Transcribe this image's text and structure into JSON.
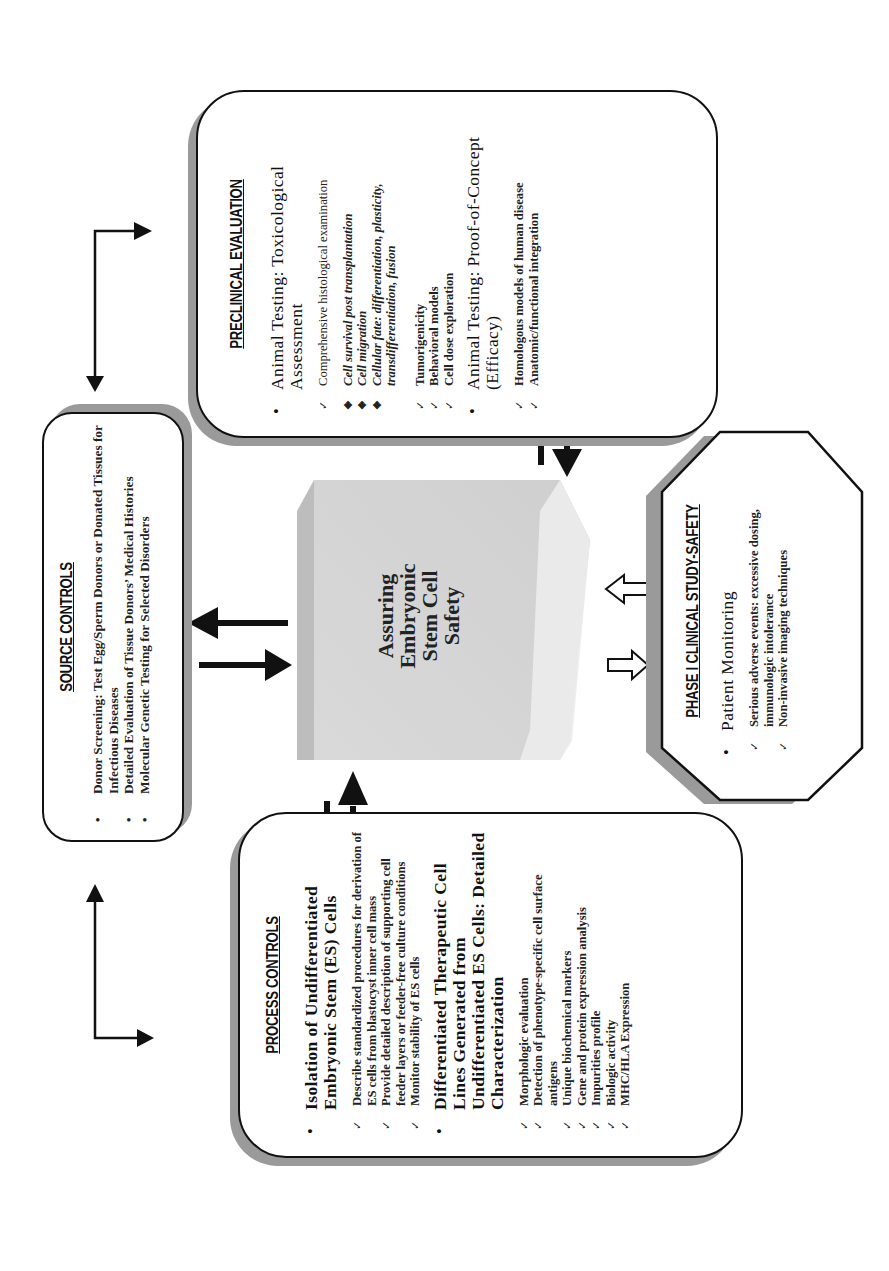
{
  "center": {
    "lines": [
      "Assuring",
      "Embryonic",
      "Stem Cell",
      "Safety"
    ]
  },
  "source_controls": {
    "title": "SOURCE CONTROLS",
    "items": [
      "Donor Screening: Test Egg/Sperm Donors or Donated Tissues for Infectious Diseases",
      "Detailed Evaluation of Tissue Donors’ Medical Histories",
      "Molecular Genetic Testing for Selected Disorders"
    ]
  },
  "preclinical_evaluation": {
    "title": "PRECLINICAL EVALUATION",
    "sections": [
      {
        "heading": "Animal Testing: Toxicological Assessment",
        "checks_a": [
          "Comprehensive histological examination"
        ],
        "sub_items": [
          "Cell survival post transplantation",
          "Cell migration",
          "Cellular fate: differentiation, plasticity, transdifferentiation, fusion"
        ],
        "checks_b": [
          "Tumorigenicity",
          "Behavioral models",
          "Cell dose exploration"
        ]
      },
      {
        "heading": "Animal Testing: Proof-of-Concept (Efficacy)",
        "checks": [
          "Homologous models of human disease",
          "Anatomic/functional integration"
        ]
      }
    ]
  },
  "process_controls": {
    "title": "PROCESS CONTROLS",
    "sections": [
      {
        "heading": "Isolation of Undifferentiated Embryonic Stem (ES) Cells",
        "checks": [
          "Describe standardized procedures for derivation of ES cells from blastocyst inner cell mass",
          "Provide detailed description of supporting cell feeder layers or feeder-free culture conditions",
          "Monitor stability of ES cells"
        ]
      },
      {
        "heading": "Differentiated Therapeutic Cell Lines Generated from Undifferentiated ES Cells: Detailed Characterization",
        "checks": [
          "Morphologic evaluation",
          "Detection of phenotype-specific cell surface antigens",
          "Unique biochemical markers",
          "Gene and protein expression analysis",
          "Impurities profile",
          "Biologic activity",
          "MHC/HLA Expression"
        ]
      }
    ]
  },
  "phase1": {
    "title": "PHASE I CLINICAL STUDY-SAFETY",
    "heading": "Patient Monitoring",
    "checks": [
      "Serious adverse events: excessive dosing, immunologic intolerance",
      "Non-invasive imaging techniques"
    ]
  },
  "colors": {
    "line": "#111111",
    "shadow": "#9a9a9a",
    "slab_face": "#d4d4d4",
    "slab_side": "#bdbdbd",
    "slab_bottom": "#ececec"
  }
}
